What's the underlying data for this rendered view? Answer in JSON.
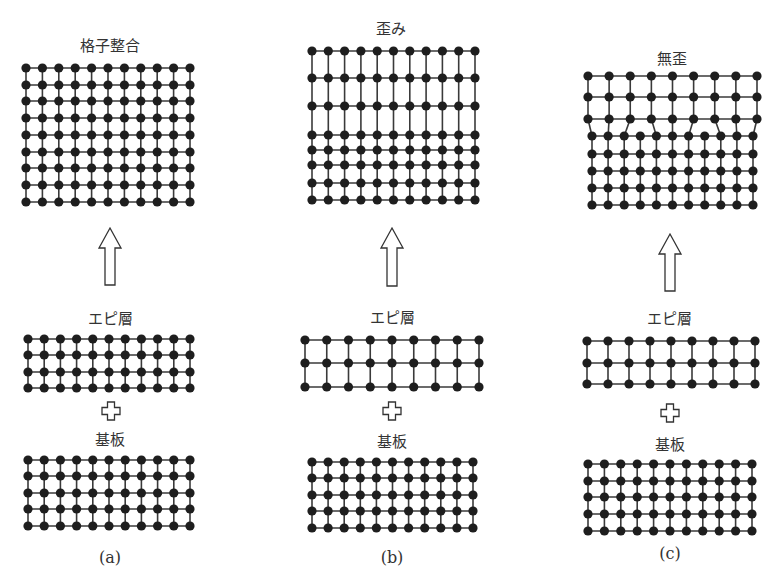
{
  "figure": {
    "style": {
      "line_color": "#3a3a3a",
      "atom_color": "#1e1e1e",
      "atom_radius": 4.6,
      "line_width": 1.6
    },
    "panels": [
      {
        "id": "a",
        "caption": "(a)",
        "caption_pos": [
          110,
          557
        ],
        "result_title": "格子整合",
        "result_title_pos": [
          110,
          44
        ],
        "epi_label": "エピ層",
        "epi_label_pos": [
          110,
          317
        ],
        "substrate_label": "基板",
        "substrate_label_pos": [
          110,
          438
        ],
        "arrow": {
          "x": 110,
          "y_top": 228,
          "y_bottom": 285
        },
        "plus": {
          "x": 111,
          "y": 411
        },
        "result_lattice": {
          "type": "uniform",
          "cols": 11,
          "x0": 26,
          "x1": 190,
          "rows_y": [
            68,
            85,
            101,
            118,
            135,
            152,
            168,
            185,
            202
          ]
        },
        "epi_lattice": {
          "type": "uniform",
          "cols": 11,
          "x0": 28,
          "x1": 190,
          "rows_y": [
            339,
            355,
            372,
            388
          ]
        },
        "substrate_lattice": {
          "type": "uniform",
          "cols": 11,
          "x0": 28,
          "x1": 190,
          "rows_y": [
            460,
            476,
            493,
            509,
            526
          ]
        }
      },
      {
        "id": "b",
        "caption": "(b)",
        "caption_pos": [
          392,
          557
        ],
        "result_title": "歪み",
        "result_title_pos": [
          391,
          27
        ],
        "epi_label": "エピ層",
        "epi_label_pos": [
          392,
          316
        ],
        "substrate_label": "基板",
        "substrate_label_pos": [
          392,
          440
        ],
        "arrow": {
          "x": 392,
          "y_top": 228,
          "y_bottom": 286
        },
        "plus": {
          "x": 392,
          "y": 411
        },
        "result_lattice": {
          "type": "uniform",
          "cols": 11,
          "x0": 312,
          "x1": 475,
          "rows_y": [
            51,
            78,
            106,
            135,
            150,
            165,
            183,
            200
          ]
        },
        "epi_lattice": {
          "type": "uniform",
          "cols": 9,
          "x0": 305,
          "x1": 479,
          "rows_y": [
            340,
            363,
            387
          ]
        },
        "substrate_lattice": {
          "type": "uniform",
          "cols": 11,
          "x0": 312,
          "x1": 473,
          "rows_y": [
            462,
            478,
            495,
            511,
            528
          ]
        }
      },
      {
        "id": "c",
        "caption": "(c)",
        "caption_pos": [
          670,
          553
        ],
        "result_title": "無歪",
        "result_title_pos": [
          672,
          57
        ],
        "epi_label": "エピ層",
        "epi_label_pos": [
          669,
          317
        ],
        "substrate_label": "基板",
        "substrate_label_pos": [
          670,
          443
        ],
        "arrow": {
          "x": 670,
          "y_top": 234,
          "y_bottom": 291
        },
        "plus": {
          "x": 670,
          "y": 413
        },
        "result_lattice": {
          "type": "misfit",
          "upper": {
            "cols": 9,
            "x0": 588,
            "x1": 757,
            "rows_y": [
              76,
              97,
              119
            ]
          },
          "lower": {
            "cols": 11,
            "x0": 592,
            "x1": 753,
            "rows_y": [
              136,
              154,
              171,
              188,
              205
            ]
          },
          "extra_half_planes": [
            3,
            7
          ]
        },
        "epi_lattice": {
          "type": "uniform",
          "cols": 9,
          "x0": 587,
          "x1": 755,
          "rows_y": [
            341,
            363,
            384
          ]
        },
        "substrate_lattice": {
          "type": "uniform",
          "cols": 11,
          "x0": 588,
          "x1": 752,
          "rows_y": [
            464,
            481,
            497,
            514,
            531
          ]
        }
      }
    ]
  }
}
